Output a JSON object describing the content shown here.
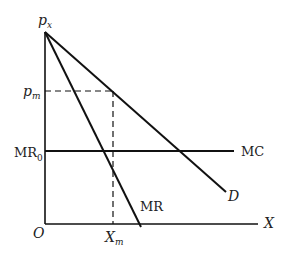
{
  "diagram": {
    "type": "economics-monopoly",
    "colors": {
      "line": "#111111",
      "text": "#222222",
      "background": "#ffffff"
    },
    "labels": {
      "y_axis_top": "p",
      "y_axis_top_sub": "x",
      "p_m": "p",
      "p_m_sub": "m",
      "mr0": "MR",
      "mr0_sub": "0",
      "origin": "O",
      "x_m": "X",
      "x_m_sub": "m",
      "x_axis": "X",
      "mc": "MC",
      "demand": "D",
      "mr": "MR"
    },
    "curves": [
      {
        "name": "D",
        "from": [
          45,
          32
        ],
        "to": [
          226,
          192
        ]
      },
      {
        "name": "MR",
        "from": [
          45,
          32
        ],
        "to": [
          141,
          227
        ]
      },
      {
        "name": "MC",
        "from": [
          45,
          151
        ],
        "to": [
          234,
          151
        ]
      }
    ],
    "guides": [
      {
        "name": "p_m",
        "y": 91,
        "x_from": 45,
        "x_to": 113
      },
      {
        "name": "X_m",
        "x": 113,
        "y_from": 91,
        "y_to": 224
      }
    ]
  }
}
